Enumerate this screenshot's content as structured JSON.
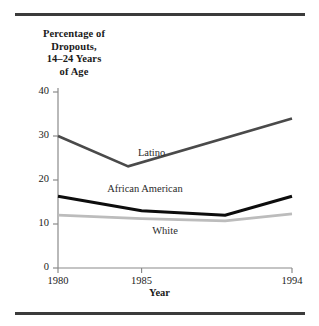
{
  "figure": {
    "y_axis_title_lines": [
      "Percentage of",
      "Dropouts,",
      "14–24 Years",
      "of Age"
    ],
    "x_axis_title": "Year"
  },
  "chart_data": {
    "type": "line",
    "title": "Percentage of Dropouts, 14–24 Years of Age",
    "xlabel": "Year",
    "ylabel": "Percentage of Dropouts, 14–24 Years of Age",
    "xlim": [
      1980,
      1994
    ],
    "ylim": [
      0,
      40
    ],
    "x_ticks": [
      1980,
      1985,
      1994
    ],
    "y_ticks": [
      0,
      10,
      20,
      30,
      40
    ],
    "grid": false,
    "legend": "inline-labels",
    "series": [
      {
        "name": "Latino",
        "color": "#4a4a4a",
        "width": 2.6,
        "label_x": 1985.6,
        "label_y": 26.0,
        "points": [
          {
            "x": 1980,
            "y": 30.0
          },
          {
            "x": 1984.2,
            "y": 23.1
          },
          {
            "x": 1994,
            "y": 34.0
          }
        ]
      },
      {
        "name": "African American",
        "color": "#0d0d0d",
        "width": 3.1,
        "label_x": 1985.2,
        "label_y": 17.8,
        "points": [
          {
            "x": 1980,
            "y": 16.3
          },
          {
            "x": 1985,
            "y": 13.0
          },
          {
            "x": 1990,
            "y": 12.0
          },
          {
            "x": 1994,
            "y": 16.3
          }
        ]
      },
      {
        "name": "White",
        "color": "#bcbcbc",
        "width": 2.8,
        "label_x": 1986.4,
        "label_y": 8.2,
        "points": [
          {
            "x": 1980,
            "y": 12.0
          },
          {
            "x": 1985,
            "y": 11.2
          },
          {
            "x": 1990,
            "y": 10.7
          },
          {
            "x": 1994,
            "y": 12.3
          }
        ]
      }
    ]
  }
}
